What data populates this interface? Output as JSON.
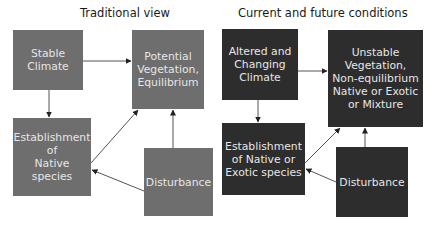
{
  "panels": [
    {
      "title": "Traditional view",
      "style": "light",
      "box_color": "#6e6e6e",
      "nodes": {
        "climate": "Stable\nClimate",
        "vegetation": "Potential\nVegetation,\nEquilibrium",
        "establishment": "Establishment\nof\nNative species",
        "disturbance": "Disturbance"
      }
    },
    {
      "title": "Current and future conditions",
      "style": "dark",
      "box_color": "#2d2d2d",
      "nodes": {
        "climate": "Altered and\nChanging\nClimate",
        "vegetation": "Unstable\nVegetation,\nNon-equilibrium\nNative or Exotic\nor Mixture",
        "establishment": "Establishment\nof Native or\nExotic species",
        "disturbance": "Disturbance"
      }
    }
  ],
  "edges": [
    {
      "from": "climate",
      "to": "vegetation"
    },
    {
      "from": "climate",
      "to": "establishment"
    },
    {
      "from": "establishment",
      "to": "vegetation"
    },
    {
      "from": "disturbance",
      "to": "vegetation"
    },
    {
      "from": "disturbance",
      "to": "establishment"
    }
  ]
}
